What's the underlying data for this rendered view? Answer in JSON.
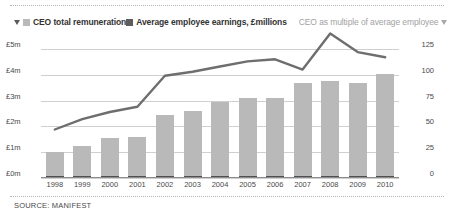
{
  "legend": {
    "marker_left_icon": "triangle-down-icon",
    "marker_right_icon": "triangle-down-icon",
    "items": [
      {
        "label": "CEO total remuneration",
        "swatch_color": "#b9b9b9",
        "type": "bar"
      },
      {
        "label": "Average employee earnings, £millions",
        "swatch_color": "#5d5d5d",
        "type": "bar"
      },
      {
        "label": "CEO as multiple of average employee",
        "swatch_color": "#808080",
        "type": "line"
      }
    ]
  },
  "footer": {
    "source": "SOURCE: MANIFEST"
  },
  "chart_data": {
    "type": "bar",
    "title": "",
    "subtitle": "",
    "xlabel": "",
    "ylabel": "",
    "categories": [
      "1998",
      "1999",
      "2000",
      "2001",
      "2002",
      "2003",
      "2004",
      "2005",
      "2006",
      "2007",
      "2008",
      "2009",
      "2010"
    ],
    "left_axis": {
      "label": "",
      "ylim": [
        0,
        5
      ],
      "ticks": [
        0,
        1,
        2,
        3,
        4,
        5
      ],
      "tick_labels": [
        "£0m",
        "£1m",
        "£2m",
        "£3m",
        "£4m",
        "£5m"
      ],
      "unit": "£ millions"
    },
    "right_axis": {
      "label": "",
      "ylim": [
        0,
        125
      ],
      "ticks": [
        0,
        25,
        50,
        75,
        100,
        125
      ],
      "tick_labels": [
        "0",
        "25",
        "50",
        "75",
        "100",
        "125"
      ],
      "unit": "multiple"
    },
    "grid": true,
    "legend_position": "top",
    "series": [
      {
        "name": "CEO total remuneration",
        "type": "bar",
        "axis": "left",
        "color": "#b9b9b9",
        "values": [
          1.0,
          1.25,
          1.55,
          1.6,
          2.45,
          2.6,
          2.95,
          3.1,
          3.1,
          3.7,
          3.75,
          3.7,
          4.05
        ]
      },
      {
        "name": "Average employee earnings, £millions",
        "type": "bar",
        "axis": "left",
        "color": "#4f4f4f",
        "values": [
          0.021,
          0.022,
          0.023,
          0.024,
          0.025,
          0.026,
          0.027,
          0.028,
          0.029,
          0.03,
          0.031,
          0.032,
          0.033
        ]
      },
      {
        "name": "CEO as multiple of average employee",
        "type": "line",
        "axis": "right",
        "color": "#6e6e6e",
        "values": [
          47,
          57,
          64,
          69,
          99,
          103,
          108,
          113,
          115,
          105,
          140,
          122,
          117
        ]
      }
    ]
  }
}
